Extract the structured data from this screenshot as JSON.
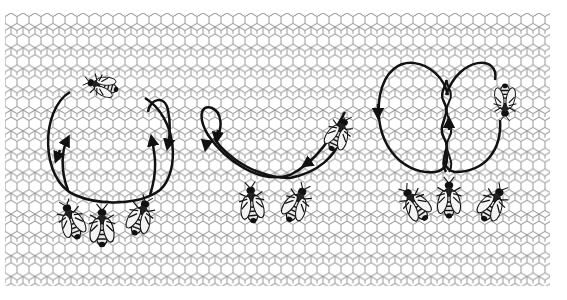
{
  "figure": {
    "background": {
      "pattern": "hexagonal honeycomb",
      "cell_stroke": "#9a9a9a",
      "fill": "#ffffff",
      "extent": {
        "x0": 5,
        "y0": 13,
        "x1": 550,
        "y1": 286
      }
    },
    "ink_color": "#111111",
    "panels": [
      {
        "id": "round-dance",
        "name": "Round dance",
        "center_x": 105,
        "followers": 3,
        "dancer_position": "top"
      },
      {
        "id": "sickle-dance",
        "name": "Sickle dance",
        "center_x": 275,
        "followers": 2,
        "dancer_position": "right"
      },
      {
        "id": "waggle-dance",
        "name": "Waggle dance",
        "center_x": 450,
        "followers": 3,
        "dancer_position": "right"
      }
    ]
  }
}
